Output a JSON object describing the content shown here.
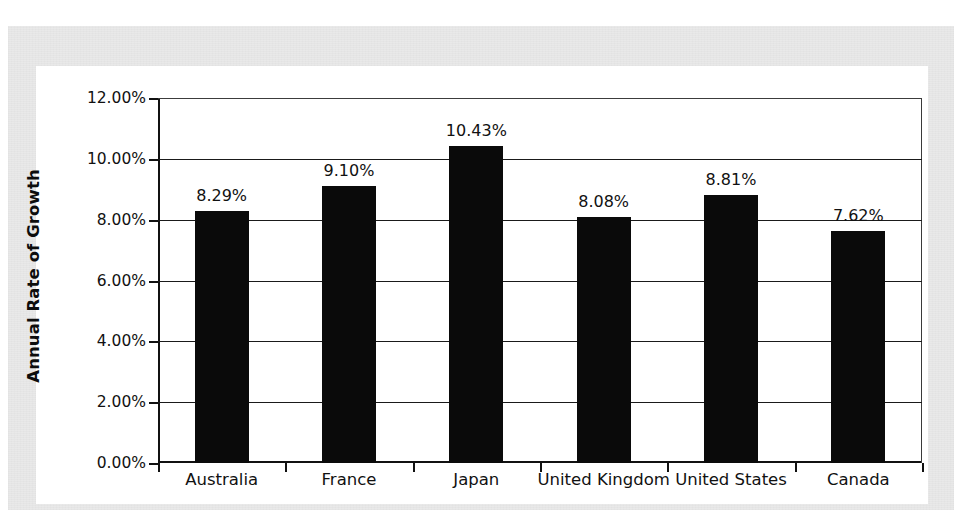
{
  "chart_data": {
    "type": "bar",
    "title": "",
    "xlabel": "",
    "ylabel": "Annual Rate of Growth",
    "categories": [
      "Australia",
      "France",
      "Japan",
      "United Kingdom",
      "United States",
      "Canada"
    ],
    "values": [
      8.29,
      9.1,
      10.43,
      8.08,
      8.81,
      7.62
    ],
    "value_labels": [
      "8.29%",
      "9.10%",
      "10.43%",
      "8.08%",
      "8.81%",
      "7.62%"
    ],
    "ylim": [
      0,
      12
    ],
    "ytick_values": [
      0,
      2,
      4,
      6,
      8,
      10,
      12
    ],
    "ytick_labels": [
      "0.00%",
      "2.00%",
      "4.00%",
      "6.00%",
      "8.00%",
      "10.00%",
      "12.00%"
    ],
    "grid": true,
    "grid_axis": "y",
    "legend": false,
    "legend_position": "none",
    "bar_color": "#0a0a0a",
    "plot_background": "#ffffff",
    "frame_color": "#e9e9e9",
    "axis_color": "#111111",
    "units": "percent"
  }
}
